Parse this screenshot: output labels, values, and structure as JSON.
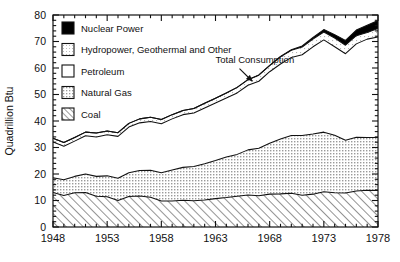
{
  "chart_data": {
    "type": "area",
    "stacked": true,
    "title": "",
    "xlabel": "",
    "ylabel": "Quadrillion Btu",
    "xlim": [
      1948,
      1978
    ],
    "ylim": [
      0,
      80
    ],
    "grid": false,
    "y_ticks": [
      0,
      10,
      20,
      30,
      40,
      50,
      60,
      70,
      80
    ],
    "y_ticklabels": [
      "0",
      "10",
      "20",
      "30",
      "40",
      "50",
      "60",
      "70",
      "80"
    ],
    "y_minor_step": 2,
    "x_ticks": [
      1948,
      1953,
      1958,
      1963,
      1968,
      1973,
      1978
    ],
    "x_ticklabels": [
      "1948",
      "1953",
      "1958",
      "1963",
      "1968",
      "1973",
      "1978"
    ],
    "x_minor_step": 1,
    "x": [
      1948,
      1949,
      1950,
      1951,
      1952,
      1953,
      1954,
      1955,
      1956,
      1957,
      1958,
      1959,
      1960,
      1961,
      1962,
      1963,
      1964,
      1965,
      1966,
      1967,
      1968,
      1969,
      1970,
      1971,
      1972,
      1973,
      1974,
      1975,
      1976,
      1977,
      1978
    ],
    "legend_position": "upper-left-inside",
    "annotations": [
      {
        "text": "Total Consumption",
        "x": 1963.0,
        "y": 62.0,
        "arrow_to_x": 1966.4,
        "arrow_to_y": 55.0
      }
    ],
    "series": [
      {
        "name": "Coal",
        "fill": "diagonal-hatch",
        "color": "#ffffff",
        "values": [
          13.0,
          11.9,
          12.9,
          13.0,
          11.6,
          11.4,
          10.0,
          11.5,
          11.7,
          11.2,
          9.8,
          9.8,
          10.1,
          9.9,
          10.2,
          10.7,
          11.1,
          11.6,
          12.1,
          11.8,
          12.4,
          12.5,
          12.7,
          12.0,
          12.4,
          13.3,
          12.9,
          12.8,
          13.6,
          13.9,
          13.8
        ]
      },
      {
        "name": "Natural Gas",
        "fill": "gray-dots",
        "color": "#dedede",
        "values": [
          5.6,
          5.9,
          6.2,
          7.0,
          7.5,
          7.9,
          8.4,
          9.0,
          9.6,
          10.2,
          10.7,
          11.7,
          12.4,
          12.9,
          13.7,
          14.4,
          15.3,
          15.8,
          17.0,
          17.9,
          19.2,
          20.7,
          21.8,
          22.5,
          22.7,
          22.5,
          21.7,
          19.9,
          20.3,
          19.9,
          20.0
        ]
      },
      {
        "name": "Petroleum",
        "fill": "white",
        "color": "#ffffff",
        "values": [
          13.5,
          12.7,
          13.3,
          14.4,
          14.9,
          15.5,
          15.8,
          17.2,
          18.0,
          18.4,
          18.5,
          19.3,
          19.9,
          20.2,
          21.0,
          21.7,
          22.3,
          23.2,
          24.4,
          25.3,
          27.0,
          28.3,
          29.5,
          30.5,
          32.9,
          34.8,
          33.4,
          32.7,
          35.2,
          37.1,
          37.9
        ]
      },
      {
        "name": "Hydropower, Geothermal and Other",
        "fill": "light-dots",
        "color": "#f2f2f2",
        "values": [
          1.4,
          1.4,
          1.4,
          1.4,
          1.5,
          1.4,
          1.4,
          1.4,
          1.5,
          1.6,
          1.6,
          1.6,
          1.6,
          1.7,
          1.8,
          1.8,
          1.9,
          2.1,
          2.1,
          2.3,
          2.3,
          2.7,
          2.7,
          2.9,
          2.9,
          3.0,
          3.3,
          3.2,
          3.1,
          2.5,
          3.2
        ]
      },
      {
        "name": "Nuclear Power",
        "fill": "solid-black",
        "color": "#000000",
        "values": [
          0.0,
          0.0,
          0.0,
          0.0,
          0.0,
          0.0,
          0.0,
          0.0,
          0.0,
          0.0,
          0.0,
          0.0,
          0.0,
          0.0,
          0.0,
          0.0,
          0.0,
          0.0,
          0.0,
          0.1,
          0.1,
          0.2,
          0.2,
          0.4,
          0.6,
          0.9,
          1.3,
          1.8,
          2.1,
          2.7,
          3.0
        ]
      }
    ],
    "total_consumption": [
      33.5,
      31.9,
      33.8,
      35.8,
      35.5,
      36.2,
      35.6,
      39.1,
      40.8,
      41.4,
      40.6,
      42.4,
      44.0,
      44.7,
      46.7,
      48.6,
      50.6,
      52.7,
      55.6,
      57.4,
      61.0,
      64.4,
      66.9,
      68.3,
      71.5,
      74.5,
      72.6,
      70.4,
      74.3,
      76.1,
      77.9
    ]
  },
  "legend": {
    "items": [
      {
        "label": "Nuclear Power",
        "swatch": "solid-black"
      },
      {
        "label": "Hydropower, Geothermal and Other",
        "swatch": "light-dots"
      },
      {
        "label": "Petroleum",
        "swatch": "white"
      },
      {
        "label": "Natural Gas",
        "swatch": "gray-dots"
      },
      {
        "label": "Coal",
        "swatch": "diagonal-hatch"
      }
    ]
  }
}
